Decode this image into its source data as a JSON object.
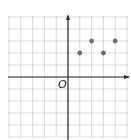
{
  "chart_data": {
    "type": "scatter",
    "title": "",
    "xlabel": "",
    "ylabel": "",
    "origin_label": "O",
    "xlim": [
      -5,
      5
    ],
    "ylim": [
      -5,
      5
    ],
    "grid": true,
    "grid_step": 1,
    "axis_arrows": [
      "x-positive",
      "y-positive"
    ],
    "points": [
      {
        "x": 1,
        "y": 2
      },
      {
        "x": 2,
        "y": 3
      },
      {
        "x": 3,
        "y": 2
      },
      {
        "x": 4,
        "y": 3
      }
    ],
    "colors": {
      "grid": "#cfcfcf",
      "axis": "#2a2a2a",
      "point": "#6e6e6e"
    }
  }
}
